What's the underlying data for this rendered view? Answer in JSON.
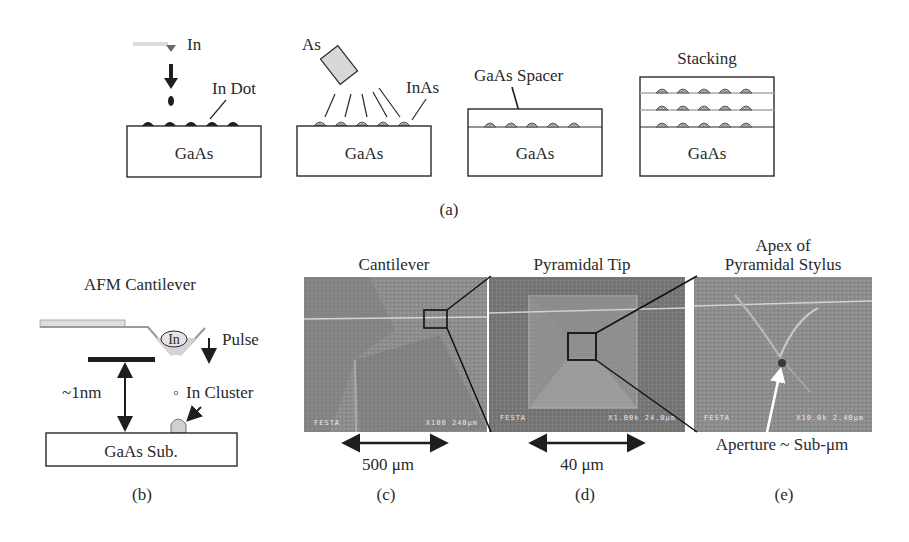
{
  "panel_a": {
    "caption": "(a)",
    "step1": {
      "source_label": "In",
      "dot_label": "In Dot",
      "substrate": "GaAs"
    },
    "step2": {
      "source_label": "As",
      "dot_label": "InAs",
      "substrate": "GaAs"
    },
    "step3": {
      "spacer_label": "GaAs Spacer",
      "substrate": "GaAs"
    },
    "step4": {
      "title": "Stacking",
      "substrate": "GaAs"
    }
  },
  "panel_b": {
    "caption": "(b)",
    "title": "AFM Cantilever",
    "tip_label": "In",
    "pulse_label": "Pulse",
    "cluster_label": "In Cluster",
    "gap_label": "~1nm",
    "substrate": "GaAs Sub."
  },
  "panel_c": {
    "caption": "(c)",
    "title": "Cantilever",
    "scale_label": "500 μm",
    "sem_left": "FESTA",
    "sem_right": "X100   240μm"
  },
  "panel_d": {
    "caption": "(d)",
    "title": "Pyramidal Tip",
    "scale_label": "40 μm",
    "sem_left": "FESTA",
    "sem_right": "X1.00k  24.0μm"
  },
  "panel_e": {
    "caption": "(e)",
    "title_line1": "Apex of",
    "title_line2": "Pyramidal Stylus",
    "aperture_label": "Aperture ~ Sub-μm",
    "sem_left": "FESTA",
    "sem_right": "X10.0k  2.40μm"
  },
  "colors": {
    "ink": "#2a2a2a",
    "dot_dark": "#1e1e1e",
    "dot_gray": "#a8a8a8",
    "sem_bg": "#8a8a8a",
    "sem_dark": "#6e6e6e"
  }
}
